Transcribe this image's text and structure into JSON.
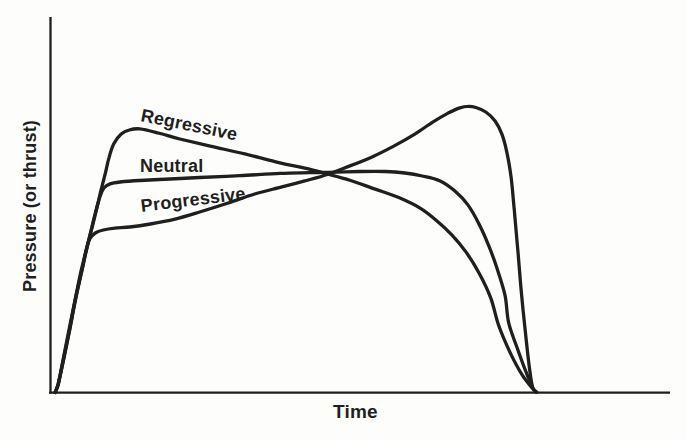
{
  "figure": {
    "paper_color": "#fdfdfc",
    "ink_color": "#1f1f1f"
  },
  "chart_data": {
    "type": "line",
    "title": "",
    "xlabel": "Time",
    "ylabel": "Pressure (or thrust)",
    "x_range": [
      0,
      1
    ],
    "y_range": [
      0,
      1
    ],
    "axis_ticks": "none",
    "grid": false,
    "legend": "inline-curve-labels",
    "series": [
      {
        "name": "Regressive",
        "points": [
          [
            0.005,
            0.0
          ],
          [
            0.01,
            0.023
          ],
          [
            0.018,
            0.081
          ],
          [
            0.028,
            0.162
          ],
          [
            0.037,
            0.239
          ],
          [
            0.047,
            0.316
          ],
          [
            0.057,
            0.389
          ],
          [
            0.065,
            0.442
          ],
          [
            0.073,
            0.495
          ],
          [
            0.079,
            0.538
          ],
          [
            0.086,
            0.583
          ],
          [
            0.092,
            0.626
          ],
          [
            0.1,
            0.664
          ],
          [
            0.112,
            0.69
          ],
          [
            0.125,
            0.701
          ],
          [
            0.142,
            0.704
          ],
          [
            0.172,
            0.693
          ],
          [
            0.207,
            0.677
          ],
          [
            0.256,
            0.658
          ],
          [
            0.312,
            0.637
          ],
          [
            0.369,
            0.613
          ],
          [
            0.409,
            0.599
          ],
          [
            0.447,
            0.583
          ],
          [
            0.482,
            0.567
          ],
          [
            0.523,
            0.543
          ],
          [
            0.563,
            0.519
          ],
          [
            0.595,
            0.493
          ],
          [
            0.621,
            0.461
          ],
          [
            0.647,
            0.421
          ],
          [
            0.67,
            0.375
          ],
          [
            0.691,
            0.319
          ],
          [
            0.71,
            0.252
          ],
          [
            0.723,
            0.178
          ],
          [
            0.741,
            0.108
          ],
          [
            0.76,
            0.049
          ],
          [
            0.777,
            0.012
          ],
          [
            0.784,
            0.001
          ]
        ]
      },
      {
        "name": "Neutral",
        "points": [
          [
            0.005,
            0.0
          ],
          [
            0.01,
            0.023
          ],
          [
            0.018,
            0.084
          ],
          [
            0.028,
            0.164
          ],
          [
            0.037,
            0.244
          ],
          [
            0.047,
            0.324
          ],
          [
            0.057,
            0.391
          ],
          [
            0.065,
            0.445
          ],
          [
            0.071,
            0.485
          ],
          [
            0.078,
            0.525
          ],
          [
            0.084,
            0.546
          ],
          [
            0.094,
            0.557
          ],
          [
            0.11,
            0.562
          ],
          [
            0.142,
            0.566
          ],
          [
            0.191,
            0.57
          ],
          [
            0.239,
            0.574
          ],
          [
            0.304,
            0.579
          ],
          [
            0.369,
            0.585
          ],
          [
            0.417,
            0.587
          ],
          [
            0.447,
            0.588
          ],
          [
            0.498,
            0.59
          ],
          [
            0.539,
            0.59
          ],
          [
            0.571,
            0.586
          ],
          [
            0.599,
            0.578
          ],
          [
            0.628,
            0.565
          ],
          [
            0.652,
            0.538
          ],
          [
            0.673,
            0.501
          ],
          [
            0.691,
            0.45
          ],
          [
            0.707,
            0.391
          ],
          [
            0.72,
            0.332
          ],
          [
            0.733,
            0.26
          ],
          [
            0.739,
            0.186
          ],
          [
            0.754,
            0.113
          ],
          [
            0.767,
            0.055
          ],
          [
            0.778,
            0.012
          ],
          [
            0.784,
            0.001
          ]
        ]
      },
      {
        "name": "Progressive",
        "points": [
          [
            0.005,
            0.0
          ],
          [
            0.01,
            0.02
          ],
          [
            0.016,
            0.071
          ],
          [
            0.024,
            0.138
          ],
          [
            0.032,
            0.204
          ],
          [
            0.04,
            0.266
          ],
          [
            0.049,
            0.33
          ],
          [
            0.055,
            0.378
          ],
          [
            0.061,
            0.41
          ],
          [
            0.07,
            0.426
          ],
          [
            0.083,
            0.434
          ],
          [
            0.102,
            0.439
          ],
          [
            0.126,
            0.442
          ],
          [
            0.159,
            0.45
          ],
          [
            0.199,
            0.463
          ],
          [
            0.239,
            0.482
          ],
          [
            0.285,
            0.506
          ],
          [
            0.328,
            0.53
          ],
          [
            0.372,
            0.549
          ],
          [
            0.409,
            0.565
          ],
          [
            0.447,
            0.583
          ],
          [
            0.482,
            0.605
          ],
          [
            0.518,
            0.629
          ],
          [
            0.553,
            0.658
          ],
          [
            0.587,
            0.69
          ],
          [
            0.616,
            0.722
          ],
          [
            0.641,
            0.746
          ],
          [
            0.66,
            0.76
          ],
          [
            0.673,
            0.764
          ],
          [
            0.686,
            0.761
          ],
          [
            0.702,
            0.749
          ],
          [
            0.717,
            0.725
          ],
          [
            0.728,
            0.69
          ],
          [
            0.736,
            0.642
          ],
          [
            0.743,
            0.573
          ],
          [
            0.748,
            0.487
          ],
          [
            0.754,
            0.375
          ],
          [
            0.76,
            0.258
          ],
          [
            0.767,
            0.146
          ],
          [
            0.773,
            0.06
          ],
          [
            0.778,
            0.012
          ],
          [
            0.784,
            0.001
          ]
        ]
      }
    ]
  }
}
